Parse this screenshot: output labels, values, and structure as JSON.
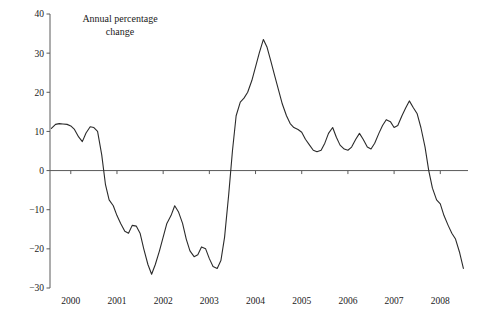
{
  "chart_data": {
    "type": "line",
    "title": "Annual percentage change",
    "title_line1": "Annual percentage",
    "title_line2": "change",
    "xlabel": "",
    "ylabel": "",
    "ylim": [
      -30,
      40
    ],
    "xlim": [
      1999.55,
      2008.6
    ],
    "grid": false,
    "legend": null,
    "y_ticks": [
      40,
      30,
      20,
      10,
      0,
      -10,
      -20,
      -30
    ],
    "y_tick_labels": [
      "40",
      "30",
      "20",
      "10",
      "0",
      "−10",
      "−20",
      "−30"
    ],
    "x_ticks": [
      2000,
      2001,
      2002,
      2003,
      2004,
      2005,
      2006,
      2007,
      2008
    ],
    "x_tick_labels": [
      "2000",
      "2001",
      "2002",
      "2003",
      "2004",
      "2005",
      "2006",
      "2007",
      "2008"
    ],
    "line_color": "#2b2b2b",
    "axis_color": "#5a5a5a",
    "background_color": "#ffffff",
    "series": [
      {
        "name": "Annual percentage change",
        "x": [
          1999.58,
          1999.67,
          1999.75,
          1999.83,
          1999.92,
          2000.0,
          2000.08,
          2000.17,
          2000.25,
          2000.33,
          2000.42,
          2000.5,
          2000.58,
          2000.67,
          2000.75,
          2000.83,
          2000.92,
          2001.0,
          2001.08,
          2001.17,
          2001.25,
          2001.33,
          2001.42,
          2001.5,
          2001.58,
          2001.67,
          2001.75,
          2001.83,
          2001.92,
          2002.0,
          2002.08,
          2002.17,
          2002.25,
          2002.33,
          2002.42,
          2002.5,
          2002.58,
          2002.67,
          2002.75,
          2002.83,
          2002.92,
          2003.0,
          2003.08,
          2003.17,
          2003.25,
          2003.33,
          2003.42,
          2003.5,
          2003.58,
          2003.67,
          2003.75,
          2003.83,
          2003.92,
          2004.0,
          2004.08,
          2004.17,
          2004.25,
          2004.33,
          2004.42,
          2004.5,
          2004.58,
          2004.67,
          2004.75,
          2004.83,
          2004.92,
          2005.0,
          2005.08,
          2005.17,
          2005.25,
          2005.33,
          2005.42,
          2005.5,
          2005.58,
          2005.67,
          2005.75,
          2005.83,
          2005.92,
          2006.0,
          2006.08,
          2006.17,
          2006.25,
          2006.33,
          2006.42,
          2006.5,
          2006.58,
          2006.67,
          2006.75,
          2006.83,
          2006.92,
          2007.0,
          2007.08,
          2007.17,
          2007.25,
          2007.33,
          2007.42,
          2007.5,
          2007.58,
          2007.67,
          2007.75,
          2007.83,
          2007.92,
          2008.0,
          2008.08,
          2008.17,
          2008.25,
          2008.33,
          2008.42,
          2008.5
        ],
        "y": [
          10.8,
          11.8,
          12.0,
          11.9,
          11.8,
          11.4,
          10.5,
          8.6,
          7.4,
          9.6,
          11.2,
          11.0,
          10.0,
          4.0,
          -3.5,
          -7.5,
          -9.0,
          -11.5,
          -13.5,
          -15.5,
          -16.0,
          -14.0,
          -14.2,
          -16.0,
          -20.0,
          -24.0,
          -26.5,
          -24.0,
          -20.5,
          -17.0,
          -13.5,
          -11.5,
          -9.0,
          -10.5,
          -13.5,
          -17.5,
          -20.5,
          -22.0,
          -21.5,
          -19.5,
          -20.0,
          -22.5,
          -24.5,
          -25.0,
          -23.0,
          -17.0,
          -6.0,
          5.0,
          14.0,
          17.5,
          18.5,
          20.0,
          23.0,
          26.5,
          30.0,
          33.5,
          31.5,
          28.0,
          24.0,
          20.5,
          17.0,
          14.0,
          12.0,
          11.0,
          10.5,
          9.8,
          8.0,
          6.5,
          5.2,
          4.8,
          5.2,
          7.0,
          9.5,
          11.0,
          8.5,
          6.5,
          5.5,
          5.2,
          6.0,
          8.0,
          9.5,
          8.0,
          6.0,
          5.5,
          7.0,
          9.5,
          11.5,
          13.0,
          12.5,
          11.0,
          11.5,
          14.0,
          16.0,
          17.8,
          16.0,
          14.5,
          11.0,
          6.0,
          0.0,
          -4.5,
          -7.5,
          -8.5,
          -11.5,
          -14.0,
          -16.0,
          -17.5,
          -21.0,
          -25.0
        ]
      }
    ]
  },
  "layout": {
    "plot_left": 50,
    "plot_right": 468,
    "plot_top": 14,
    "plot_bottom": 288,
    "title_x": 120,
    "title_y1": 22,
    "title_y2": 35
  }
}
